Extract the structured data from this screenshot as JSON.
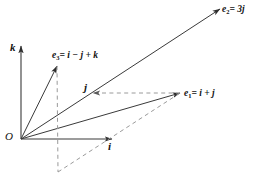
{
  "figure": {
    "type": "vector-diagram",
    "background_color": "#ffffff",
    "stroke_color": "#3a3a3a",
    "dash_color": "#8a8a8a",
    "text_color": "#111111",
    "width": 265,
    "height": 189
  },
  "origin": {
    "label": "O",
    "x": 21,
    "y": 139
  },
  "axes": [
    {
      "name": "k-axis",
      "label": "k",
      "from": [
        21,
        139
      ],
      "to": [
        21,
        46
      ],
      "style": "solid",
      "arrow": true
    },
    {
      "name": "i-axis",
      "label": "i",
      "from": [
        21,
        139
      ],
      "to": [
        112,
        139
      ],
      "style": "solid",
      "arrow": true
    }
  ],
  "vectors": [
    {
      "name": "e1",
      "label_base": "e",
      "label_sub": "1",
      "label_eq": "=",
      "label_expr": "i + j",
      "label_full": "e1 = i + j",
      "from": [
        21,
        139
      ],
      "to": [
        180,
        93
      ],
      "style": "solid",
      "arrow": true
    },
    {
      "name": "e2",
      "label_base": "e",
      "label_sub": "2",
      "label_eq": "=",
      "label_expr": "3j",
      "label_full": "e2 = 3j",
      "from": [
        21,
        139
      ],
      "to": [
        220,
        9
      ],
      "style": "solid",
      "arrow": true
    },
    {
      "name": "e3",
      "label_base": "e",
      "label_sub": "3",
      "label_eq": "=",
      "label_expr": "i - j + k",
      "label_full": "e3 = i - j + k",
      "from": [
        21,
        139
      ],
      "to": [
        57,
        66
      ],
      "style": "solid",
      "arrow": true
    }
  ],
  "construction_lines": [
    {
      "name": "vertical-drop-from-e3",
      "from": [
        57,
        66
      ],
      "to": [
        58,
        172
      ],
      "style": "dashed",
      "arrow": false
    },
    {
      "name": "diagonal-to-e1",
      "from": [
        58,
        172
      ],
      "to": [
        180,
        93
      ],
      "style": "dashed",
      "arrow": false
    },
    {
      "name": "horizontal-j-component",
      "from": [
        180,
        93
      ],
      "to": [
        93,
        93
      ],
      "style": "dashed",
      "arrow": true
    }
  ],
  "labels": {
    "origin": "O",
    "k": "k",
    "i": "i",
    "j": "j",
    "e1_base": "e",
    "e1_sub": "1",
    "e1_rest": "= i + j",
    "e2_base": "e",
    "e2_sub": "2",
    "e2_rest": "= 3j",
    "e3_base": "e",
    "e3_sub": "3",
    "e3_rest": "= i − j + k"
  }
}
